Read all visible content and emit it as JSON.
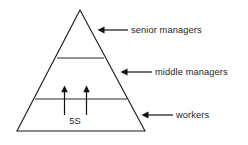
{
  "diagram": {
    "type": "pyramid-hierarchy",
    "canvas": {
      "width": 248,
      "height": 145
    },
    "background_color": "#ffffff",
    "line_color": "#1a1a1a",
    "text_color": "#262626",
    "tiers": [
      {
        "id": "tier-top",
        "label": "senior managers",
        "leader_arrow": "left-arrow-icon"
      },
      {
        "id": "tier-middle",
        "label": "middle managers",
        "leader_arrow": "left-arrow-icon"
      },
      {
        "id": "tier-bottom",
        "label": "workers",
        "leader_arrow": "left-arrow-icon"
      }
    ],
    "inner_annotation": {
      "label": "5S",
      "up_arrow_count": 2,
      "up_arrow_icon": "up-arrow-icon"
    }
  }
}
